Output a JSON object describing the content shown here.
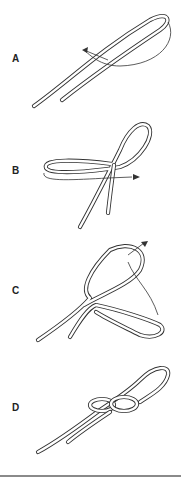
{
  "diagram": {
    "type": "knot-tying-steps",
    "steps": [
      {
        "label": "A"
      },
      {
        "label": "B"
      },
      {
        "label": "C"
      },
      {
        "label": "D"
      }
    ],
    "colors": {
      "rope_outline": "#333333",
      "rope_fill": "#ffffff",
      "rule": "#8a8a8a"
    }
  }
}
